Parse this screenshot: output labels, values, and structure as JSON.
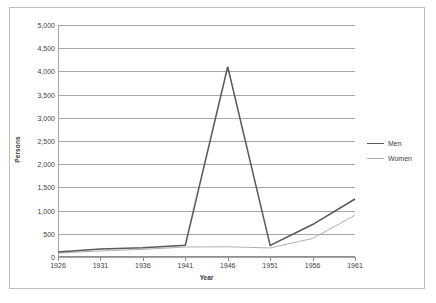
{
  "chart_data": {
    "type": "line",
    "title": "",
    "xlabel": "Year",
    "ylabel": "Persons",
    "x": [
      1926,
      1931,
      1936,
      1941,
      1946,
      1951,
      1956,
      1961
    ],
    "categories": [
      "1926",
      "1931",
      "1936",
      "1941",
      "1946",
      "1951",
      "1956",
      "1961"
    ],
    "series": [
      {
        "name": "Men",
        "color": "#595959",
        "values": [
          110,
          175,
          200,
          255,
          4100,
          250,
          700,
          1250
        ]
      },
      {
        "name": "Women",
        "color": "#b0b0b0",
        "values": [
          85,
          130,
          165,
          215,
          220,
          195,
          400,
          900
        ]
      }
    ],
    "ylim": [
      0,
      5000
    ],
    "ytick_values": [
      0,
      500,
      1000,
      1500,
      2000,
      2500,
      3000,
      3500,
      4000,
      4500,
      5000
    ],
    "ytick_labels": [
      "0",
      "500",
      "1,000",
      "1,500",
      "2,000",
      "2,500",
      "3,000",
      "3,500",
      "4,000",
      "4,500",
      "5,000"
    ],
    "xtick_labels": [
      "1926",
      "1931",
      "1936",
      "1941",
      "1946",
      "1951",
      "1956",
      "1961"
    ],
    "grid": "horizontal",
    "legend_position": "right",
    "legend": [
      "Men",
      "Women"
    ],
    "annotations": []
  },
  "axes": {
    "y_title": "Persons",
    "x_title": "Year"
  },
  "colors": {
    "men_line": "#595959",
    "women_line": "#b0b0b0",
    "gridline": "#a6a6a6",
    "border": "#bdbdbd",
    "text": "#3d3d3d",
    "background": "#ffffff"
  }
}
